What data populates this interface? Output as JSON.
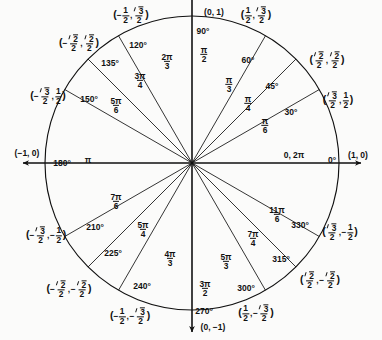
{
  "geometry": {
    "center_x": 192,
    "center_y": 163,
    "radius": 147,
    "axis_overshoot": 22
  },
  "colors": {
    "ink": "#111111",
    "background": "#fbfbfa"
  },
  "axis_labels": [
    {
      "name": "point-0-1",
      "text": "(0, 1)",
      "x": 214,
      "y": 12
    },
    {
      "name": "point-1-0",
      "text": "(1, 0)",
      "x": 358,
      "y": 155
    },
    {
      "name": "point-neg1-0",
      "text": "(−1, 0)",
      "x": 27,
      "y": 153
    },
    {
      "name": "point-0-neg1",
      "text": "(0, −1)",
      "x": 213,
      "y": 327
    }
  ],
  "axis_angle_labels": [
    {
      "name": "angle-90",
      "deg": "90°",
      "x": 203,
      "y": 31
    },
    {
      "name": "angle-270",
      "deg": "270°",
      "x": 204,
      "y": 311
    },
    {
      "name": "angle-0",
      "deg": "0°",
      "x": 332,
      "y": 160
    },
    {
      "name": "angle-180",
      "deg": "180°",
      "x": 62,
      "y": 163
    },
    {
      "name": "radian-0-2pi",
      "deg": "0, 2π",
      "x": 294,
      "y": 155
    },
    {
      "name": "radian-pi",
      "deg": "π",
      "x": 88,
      "y": 160
    }
  ],
  "chart_data": {
    "type": "unit-circle",
    "radius": 1,
    "spoke_count": 16,
    "points": [
      {
        "degrees": 0,
        "radians": "0, 2π",
        "x": "1",
        "y": "0"
      },
      {
        "degrees": 30,
        "radians": "π/6",
        "x": "√3/2",
        "y": "1/2"
      },
      {
        "degrees": 45,
        "radians": "π/4",
        "x": "√2/2",
        "y": "√2/2"
      },
      {
        "degrees": 60,
        "radians": "π/3",
        "x": "1/2",
        "y": "√3/2"
      },
      {
        "degrees": 90,
        "radians": "π/2",
        "x": "0",
        "y": "1"
      },
      {
        "degrees": 120,
        "radians": "2π/3",
        "x": "−1/2",
        "y": "√3/2"
      },
      {
        "degrees": 135,
        "radians": "3π/4",
        "x": "−√2/2",
        "y": "√2/2"
      },
      {
        "degrees": 150,
        "radians": "5π/6",
        "x": "−√3/2",
        "y": "1/2"
      },
      {
        "degrees": 180,
        "radians": "π",
        "x": "−1",
        "y": "0"
      },
      {
        "degrees": 210,
        "radians": "7π/6",
        "x": "−√3/2",
        "y": "−1/2"
      },
      {
        "degrees": 225,
        "radians": "5π/4",
        "x": "−√2/2",
        "y": "−√2/2"
      },
      {
        "degrees": 240,
        "radians": "4π/3",
        "x": "−1/2",
        "y": "−√3/2"
      },
      {
        "degrees": 270,
        "radians": "3π/2",
        "x": "0",
        "y": "−1"
      },
      {
        "degrees": 300,
        "radians": "5π/3",
        "x": "1/2",
        "y": "−√3/2"
      },
      {
        "degrees": 315,
        "radians": "7π/4",
        "x": "√2/2",
        "y": "−√2/2"
      },
      {
        "degrees": 330,
        "radians": "11π/6",
        "x": "√3/2",
        "y": "−1/2"
      }
    ]
  },
  "degree_labels": [
    {
      "name": "deg-120",
      "text": "120°",
      "x": 138,
      "y": 45
    },
    {
      "name": "deg-135",
      "text": "135°",
      "x": 110,
      "y": 63
    },
    {
      "name": "deg-150",
      "text": "150°",
      "x": 89,
      "y": 99
    },
    {
      "name": "deg-60",
      "text": "60°",
      "x": 248,
      "y": 60
    },
    {
      "name": "deg-45",
      "text": "45°",
      "x": 272,
      "y": 86
    },
    {
      "name": "deg-30",
      "text": "30°",
      "x": 291,
      "y": 112
    },
    {
      "name": "deg-210",
      "text": "210°",
      "x": 95,
      "y": 227
    },
    {
      "name": "deg-225",
      "text": "225°",
      "x": 113,
      "y": 253
    },
    {
      "name": "deg-240",
      "text": "240°",
      "x": 142,
      "y": 286
    },
    {
      "name": "deg-330",
      "text": "330°",
      "x": 300,
      "y": 225
    },
    {
      "name": "deg-315",
      "text": "315°",
      "x": 281,
      "y": 259
    },
    {
      "name": "deg-300",
      "text": "300°",
      "x": 246,
      "y": 288
    }
  ],
  "radian_labels": [
    {
      "name": "rad-2pi-3",
      "num": "2π",
      "den": "3",
      "x": 167,
      "y": 62
    },
    {
      "name": "rad-3pi-4",
      "num": "3π",
      "den": "4",
      "x": 140,
      "y": 81
    },
    {
      "name": "rad-5pi-6",
      "num": "5π",
      "den": "6",
      "x": 116,
      "y": 106
    },
    {
      "name": "rad-pi-3",
      "num": "π",
      "den": "3",
      "x": 229,
      "y": 85
    },
    {
      "name": "rad-pi-4",
      "num": "π",
      "den": "4",
      "x": 248,
      "y": 104
    },
    {
      "name": "rad-pi-6",
      "num": "π",
      "den": "6",
      "x": 265,
      "y": 126
    },
    {
      "name": "rad-pi-2",
      "num": "π",
      "den": "2",
      "x": 204,
      "y": 55
    },
    {
      "name": "rad-3pi-2",
      "num": "3π",
      "den": "2",
      "x": 205,
      "y": 289
    },
    {
      "name": "rad-7pi-6",
      "num": "7π",
      "den": "6",
      "x": 116,
      "y": 202
    },
    {
      "name": "rad-5pi-4",
      "num": "5π",
      "den": "4",
      "x": 143,
      "y": 230
    },
    {
      "name": "rad-4pi-3",
      "num": "4π",
      "den": "3",
      "x": 170,
      "y": 259
    },
    {
      "name": "rad-5pi-3",
      "num": "5π",
      "den": "3",
      "x": 226,
      "y": 262
    },
    {
      "name": "rad-7pi-4",
      "num": "7π",
      "den": "4",
      "x": 253,
      "y": 239
    },
    {
      "name": "rad-11pi-6",
      "num": "11π",
      "den": "6",
      "x": 277,
      "y": 215
    }
  ],
  "coordinate_labels": [
    {
      "name": "coord-120",
      "xneg": true,
      "xnum": "1",
      "xden": "2",
      "xrad": false,
      "yneg": false,
      "ynum": "3",
      "yden": "2",
      "yrad": true,
      "px": 131,
      "py": 16
    },
    {
      "name": "coord-135",
      "xneg": true,
      "xnum": "2",
      "xden": "2",
      "xrad": true,
      "yneg": false,
      "ynum": "2",
      "yden": "2",
      "yrad": true,
      "px": 79,
      "py": 44
    },
    {
      "name": "coord-150",
      "xneg": true,
      "xnum": "3",
      "xden": "2",
      "xrad": true,
      "yneg": false,
      "ynum": "1",
      "yden": "2",
      "yrad": false,
      "px": 48,
      "py": 97
    },
    {
      "name": "coord-60",
      "xneg": false,
      "xnum": "1",
      "xden": "2",
      "xrad": false,
      "yneg": false,
      "ynum": "3",
      "yden": "2",
      "yrad": true,
      "px": 256,
      "py": 16
    },
    {
      "name": "coord-45",
      "xneg": false,
      "xnum": "2",
      "xden": "2",
      "xrad": true,
      "yneg": false,
      "ynum": "2",
      "yden": "2",
      "yrad": true,
      "px": 327,
      "py": 61
    },
    {
      "name": "coord-30",
      "xneg": false,
      "xnum": "3",
      "xden": "2",
      "xrad": true,
      "yneg": false,
      "ynum": "1",
      "yden": "2",
      "yrad": false,
      "px": 338,
      "py": 101
    },
    {
      "name": "coord-210",
      "xneg": true,
      "xnum": "3",
      "xden": "2",
      "xrad": true,
      "yneg": true,
      "ynum": "1",
      "yden": "2",
      "yrad": false,
      "px": 46,
      "py": 236
    },
    {
      "name": "coord-225",
      "xneg": true,
      "xnum": "2",
      "xden": "2",
      "xrad": true,
      "yneg": true,
      "ynum": "2",
      "yden": "2",
      "yrad": true,
      "px": 69,
      "py": 290
    },
    {
      "name": "coord-240",
      "xneg": true,
      "xnum": "1",
      "xden": "2",
      "xrad": false,
      "yneg": true,
      "ynum": "3",
      "yden": "2",
      "yrad": true,
      "px": 130,
      "py": 317
    },
    {
      "name": "coord-330",
      "xneg": false,
      "xnum": "3",
      "xden": "2",
      "xrad": true,
      "yneg": true,
      "ynum": "1",
      "yden": "2",
      "yrad": false,
      "px": 340,
      "py": 233
    },
    {
      "name": "coord-315",
      "xneg": false,
      "xnum": "2",
      "xden": "2",
      "xrad": true,
      "yneg": true,
      "ynum": "2",
      "yden": "2",
      "yrad": true,
      "px": 320,
      "py": 281
    },
    {
      "name": "coord-300",
      "xneg": false,
      "xnum": "1",
      "xden": "2",
      "xrad": false,
      "yneg": true,
      "ynum": "3",
      "yden": "2",
      "yrad": true,
      "px": 256,
      "py": 314
    }
  ]
}
